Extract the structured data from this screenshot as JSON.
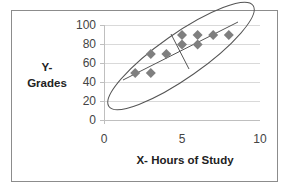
{
  "chart_data": {
    "type": "scatter",
    "title": "",
    "xlabel": "X- Hours of Study",
    "ylabel_line1": "Y-",
    "ylabel_line2": "Grades",
    "xlim": [
      0,
      10
    ],
    "ylim": [
      0,
      100
    ],
    "x_ticks": [
      "0",
      "5",
      "10"
    ],
    "y_ticks": [
      "0",
      "20",
      "40",
      "60",
      "80",
      "100"
    ],
    "grid": "horizontal",
    "legend": "none",
    "points": [
      {
        "x": 2,
        "y": 50
      },
      {
        "x": 3,
        "y": 70
      },
      {
        "x": 3,
        "y": 50
      },
      {
        "x": 4,
        "y": 70
      },
      {
        "x": 5,
        "y": 90
      },
      {
        "x": 5,
        "y": 80
      },
      {
        "x": 6,
        "y": 90
      },
      {
        "x": 6,
        "y": 80
      },
      {
        "x": 7,
        "y": 90
      },
      {
        "x": 8,
        "y": 90
      }
    ],
    "annotations": [
      "ellipse around data",
      "major axis line",
      "minor axis line"
    ],
    "marker": "diamond",
    "marker_color": "#7f7f7f"
  }
}
